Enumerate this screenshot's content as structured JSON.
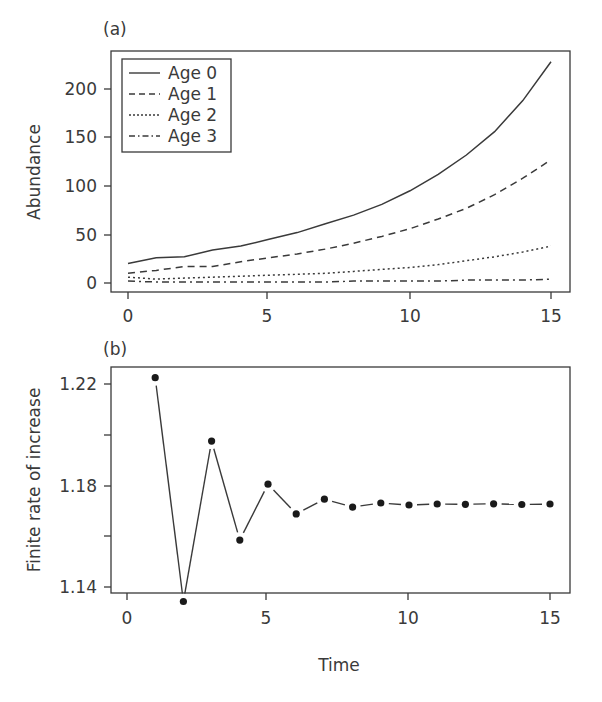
{
  "chart_data": [
    {
      "panel": "(a)",
      "type": "line",
      "title": "",
      "xlabel": "",
      "ylabel": "Abundance",
      "xlim": [
        -0.6,
        15.5
      ],
      "ylim": [
        -9,
        240
      ],
      "xticks": [
        0,
        5,
        10,
        15
      ],
      "yticks": [
        0,
        50,
        100,
        150,
        200
      ],
      "grid": false,
      "legend_position": "upper left",
      "x": [
        0,
        1,
        2,
        3,
        4,
        5,
        6,
        7,
        8,
        9,
        10,
        11,
        12,
        13,
        14,
        15
      ],
      "series": [
        {
          "name": "Age 0",
          "style": "solid",
          "values": [
            20,
            26,
            27,
            34,
            38,
            45,
            52,
            61,
            70,
            81,
            95,
            112,
            132,
            156,
            188,
            228
          ]
        },
        {
          "name": "Age 1",
          "style": "dashed",
          "values": [
            10,
            13,
            17,
            17,
            22,
            26,
            30,
            35,
            41,
            48,
            56,
            66,
            77,
            91,
            108,
            127
          ]
        },
        {
          "name": "Age 2",
          "style": "dotted",
          "values": [
            6,
            4,
            5,
            6,
            7,
            8,
            9,
            10,
            12,
            14,
            16,
            19,
            23,
            27,
            32,
            38
          ]
        },
        {
          "name": "Age 3",
          "style": "dashdot",
          "values": [
            2,
            1,
            1,
            1,
            1,
            1,
            1,
            1,
            2,
            2,
            2,
            2,
            3,
            3,
            3,
            4
          ]
        }
      ]
    },
    {
      "panel": "(b)",
      "type": "line",
      "title": "",
      "xlabel": "Time",
      "ylabel": "Finite rate of increase",
      "xlim": [
        -0.6,
        15.5
      ],
      "ylim": [
        1.1313,
        1.2254
      ],
      "xticks": [
        0,
        5,
        10,
        15
      ],
      "yticks": [
        1.14,
        1.16,
        1.18,
        1.2,
        1.22
      ],
      "ytick_labels": [
        "1.14",
        "",
        "1.18",
        "",
        "1.22"
      ],
      "grid": false,
      "markers": "filled-circle",
      "x": [
        1,
        2,
        3,
        4,
        5,
        6,
        7,
        8,
        9,
        10,
        11,
        12,
        13,
        14,
        15
      ],
      "series": [
        {
          "name": "Finite rate of increase",
          "values": [
            1.2225,
            1.1343,
            1.1975,
            1.1585,
            1.1805,
            1.1688,
            1.1746,
            1.1715,
            1.1731,
            1.1723,
            1.1727,
            1.1726,
            1.1728,
            1.1725,
            1.1727
          ]
        }
      ]
    }
  ],
  "panels": {
    "a": {
      "label": "(a)",
      "ylabel": "Abundance",
      "xtick_labels": [
        "0",
        "5",
        "10",
        "15"
      ],
      "ytick_labels": [
        "0",
        "50",
        "100",
        "150",
        "200"
      ],
      "legend": [
        "Age 0",
        "Age 1",
        "Age 2",
        "Age 3"
      ]
    },
    "b": {
      "label": "(b)",
      "ylabel": "Finite rate of increase",
      "xlabel": "Time",
      "xtick_labels": [
        "0",
        "5",
        "10",
        "15"
      ],
      "ytick_labels": [
        "1.22",
        "1.18",
        "1.14"
      ]
    }
  },
  "colors": {
    "ink": "#333333",
    "background": "#ffffff"
  }
}
